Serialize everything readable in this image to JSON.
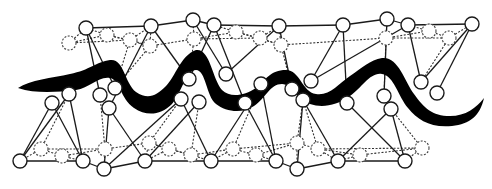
{
  "diagram": {
    "title": "",
    "colors": {
      "background": "#ffffff",
      "line": "#1a1a1a",
      "ribbon": "#000000",
      "node_fill": "#ffffff"
    },
    "node_radius": 7,
    "nodes_solid": [
      {
        "id": "t1",
        "x": 86,
        "y": 28
      },
      {
        "id": "t2",
        "x": 151,
        "y": 26
      },
      {
        "id": "t3",
        "x": 193,
        "y": 20
      },
      {
        "id": "t4",
        "x": 214,
        "y": 25
      },
      {
        "id": "t5",
        "x": 279,
        "y": 26
      },
      {
        "id": "t6",
        "x": 343,
        "y": 25
      },
      {
        "id": "t7",
        "x": 387,
        "y": 19
      },
      {
        "id": "t8",
        "x": 408,
        "y": 25
      },
      {
        "id": "t9",
        "x": 472,
        "y": 24
      },
      {
        "id": "m1",
        "x": 115,
        "y": 88
      },
      {
        "id": "m2",
        "x": 189,
        "y": 79
      },
      {
        "id": "m3",
        "x": 226,
        "y": 74
      },
      {
        "id": "m4",
        "x": 292,
        "y": 89
      },
      {
        "id": "m5",
        "x": 311,
        "y": 81
      },
      {
        "id": "m6",
        "x": 384,
        "y": 96
      },
      {
        "id": "m7",
        "x": 421,
        "y": 82
      },
      {
        "id": "m8",
        "x": 437,
        "y": 93
      },
      {
        "id": "u1",
        "x": 52,
        "y": 103
      },
      {
        "id": "u2",
        "x": 69,
        "y": 94
      },
      {
        "id": "u3",
        "x": 100,
        "y": 95
      },
      {
        "id": "u4",
        "x": 109,
        "y": 108
      },
      {
        "id": "u5",
        "x": 181,
        "y": 99
      },
      {
        "id": "u6",
        "x": 199,
        "y": 102
      },
      {
        "id": "u7",
        "x": 245,
        "y": 103
      },
      {
        "id": "u8",
        "x": 261,
        "y": 84
      },
      {
        "id": "u9",
        "x": 303,
        "y": 100
      },
      {
        "id": "u10",
        "x": 347,
        "y": 103
      },
      {
        "id": "u11",
        "x": 391,
        "y": 109
      },
      {
        "id": "b1",
        "x": 20,
        "y": 161
      },
      {
        "id": "b2",
        "x": 83,
        "y": 161
      },
      {
        "id": "b3",
        "x": 104,
        "y": 169
      },
      {
        "id": "b4",
        "x": 145,
        "y": 161
      },
      {
        "id": "b5",
        "x": 211,
        "y": 161
      },
      {
        "id": "b6",
        "x": 276,
        "y": 161
      },
      {
        "id": "b7",
        "x": 297,
        "y": 169
      },
      {
        "id": "b8",
        "x": 338,
        "y": 161
      },
      {
        "id": "b9",
        "x": 405,
        "y": 161
      }
    ],
    "nodes_dashed": [
      {
        "id": "d1",
        "x": 69,
        "y": 43
      },
      {
        "id": "d2",
        "x": 107,
        "y": 35
      },
      {
        "id": "d3",
        "x": 130,
        "y": 40
      },
      {
        "id": "d4",
        "x": 150,
        "y": 46
      },
      {
        "id": "d5",
        "x": 194,
        "y": 39
      },
      {
        "id": "d6",
        "x": 236,
        "y": 32
      },
      {
        "id": "d7",
        "x": 260,
        "y": 38
      },
      {
        "id": "d8",
        "x": 281,
        "y": 45
      },
      {
        "id": "d9",
        "x": 386,
        "y": 38
      },
      {
        "id": "d10",
        "x": 429,
        "y": 31
      },
      {
        "id": "d11",
        "x": 449,
        "y": 38
      },
      {
        "id": "e1",
        "x": 41,
        "y": 149
      },
      {
        "id": "e2",
        "x": 62,
        "y": 156
      },
      {
        "id": "e3",
        "x": 105,
        "y": 149
      },
      {
        "id": "e4",
        "x": 149,
        "y": 143
      },
      {
        "id": "e5",
        "x": 169,
        "y": 149
      },
      {
        "id": "e6",
        "x": 191,
        "y": 155
      },
      {
        "id": "e7",
        "x": 233,
        "y": 149
      },
      {
        "id": "e8",
        "x": 256,
        "y": 155
      },
      {
        "id": "e9",
        "x": 297,
        "y": 143
      },
      {
        "id": "e10",
        "x": 318,
        "y": 149
      },
      {
        "id": "e11",
        "x": 360,
        "y": 155
      },
      {
        "id": "e12",
        "x": 422,
        "y": 148
      }
    ],
    "edges_solid": [
      [
        "t1",
        "t2"
      ],
      [
        "t2",
        "t3"
      ],
      [
        "t3",
        "t4"
      ],
      [
        "t4",
        "t5"
      ],
      [
        "t5",
        "t6"
      ],
      [
        "t6",
        "t7"
      ],
      [
        "t7",
        "t8"
      ],
      [
        "t8",
        "t9"
      ],
      [
        "t1",
        "m1"
      ],
      [
        "t1",
        "u3"
      ],
      [
        "t2",
        "u4"
      ],
      [
        "t2",
        "m2"
      ],
      [
        "t3",
        "m3"
      ],
      [
        "t4",
        "m2"
      ],
      [
        "t4",
        "u7"
      ],
      [
        "t5",
        "m3"
      ],
      [
        "t5",
        "m4"
      ],
      [
        "t6",
        "m5"
      ],
      [
        "t6",
        "u10"
      ],
      [
        "t7",
        "m6"
      ],
      [
        "t8",
        "m5"
      ],
      [
        "t8",
        "m7"
      ],
      [
        "t9",
        "m7"
      ],
      [
        "t9",
        "m8"
      ],
      [
        "b1",
        "b2"
      ],
      [
        "b2",
        "b3"
      ],
      [
        "b3",
        "b4"
      ],
      [
        "b4",
        "b5"
      ],
      [
        "b5",
        "b6"
      ],
      [
        "b6",
        "b7"
      ],
      [
        "b7",
        "b8"
      ],
      [
        "b8",
        "b9"
      ],
      [
        "b1",
        "u1"
      ],
      [
        "b1",
        "u2"
      ],
      [
        "b2",
        "u2"
      ],
      [
        "b2",
        "u1"
      ],
      [
        "b3",
        "u4"
      ],
      [
        "b3",
        "u5"
      ],
      [
        "b4",
        "u4"
      ],
      [
        "b4",
        "u6"
      ],
      [
        "b5",
        "u5"
      ],
      [
        "b5",
        "u8"
      ],
      [
        "b6",
        "u8"
      ],
      [
        "b6",
        "u7"
      ],
      [
        "b7",
        "u9"
      ],
      [
        "b8",
        "u9"
      ],
      [
        "b8",
        "u11"
      ],
      [
        "b9",
        "u11"
      ],
      [
        "b9",
        "u10"
      ]
    ],
    "edges_dashed": [
      [
        "d1",
        "d2"
      ],
      [
        "d2",
        "d3"
      ],
      [
        "d3",
        "d4"
      ],
      [
        "d4",
        "d5"
      ],
      [
        "d5",
        "d6"
      ],
      [
        "d6",
        "d7"
      ],
      [
        "d7",
        "d8"
      ],
      [
        "d8",
        "d9"
      ],
      [
        "d9",
        "d10"
      ],
      [
        "d10",
        "d11"
      ],
      [
        "d1",
        "t1"
      ],
      [
        "d2",
        "t1"
      ],
      [
        "d3",
        "t2"
      ],
      [
        "d4",
        "t2"
      ],
      [
        "d5",
        "t3"
      ],
      [
        "d6",
        "t4"
      ],
      [
        "d7",
        "t5"
      ],
      [
        "d8",
        "t5"
      ],
      [
        "d9",
        "t7"
      ],
      [
        "d10",
        "t8"
      ],
      [
        "d11",
        "t9"
      ],
      [
        "d1",
        "d3"
      ],
      [
        "d2",
        "d4"
      ],
      [
        "d5",
        "d7"
      ],
      [
        "d6",
        "d8"
      ],
      [
        "d9",
        "d11"
      ],
      [
        "d3",
        "m1"
      ],
      [
        "d4",
        "m1"
      ],
      [
        "d5",
        "m2"
      ],
      [
        "d8",
        "m4"
      ],
      [
        "d9",
        "m6"
      ],
      [
        "d11",
        "m7"
      ],
      [
        "e1",
        "e2"
      ],
      [
        "e2",
        "e3"
      ],
      [
        "e3",
        "e4"
      ],
      [
        "e4",
        "e5"
      ],
      [
        "e5",
        "e6"
      ],
      [
        "e6",
        "e7"
      ],
      [
        "e7",
        "e8"
      ],
      [
        "e8",
        "e9"
      ],
      [
        "e9",
        "e10"
      ],
      [
        "e10",
        "e11"
      ],
      [
        "e11",
        "e12"
      ],
      [
        "e1",
        "b1"
      ],
      [
        "e2",
        "b2"
      ],
      [
        "e3",
        "b3"
      ],
      [
        "e4",
        "b4"
      ],
      [
        "e5",
        "b4"
      ],
      [
        "e6",
        "b5"
      ],
      [
        "e7",
        "b5"
      ],
      [
        "e8",
        "b6"
      ],
      [
        "e9",
        "b7"
      ],
      [
        "e10",
        "b8"
      ],
      [
        "e11",
        "b8"
      ],
      [
        "e12",
        "b9"
      ],
      [
        "e1",
        "u2"
      ],
      [
        "e3",
        "u3"
      ],
      [
        "e4",
        "u5"
      ],
      [
        "e6",
        "u6"
      ],
      [
        "e7",
        "u8"
      ],
      [
        "e9",
        "u9"
      ],
      [
        "e10",
        "u9"
      ],
      [
        "e12",
        "u11"
      ],
      [
        "e1",
        "e3"
      ],
      [
        "e4",
        "e6"
      ],
      [
        "e7",
        "e9"
      ],
      [
        "e10",
        "e12"
      ]
    ],
    "ribbon_path": "M18,88 C30,80 52,78 70,74 C90,70 96,62 110,60 C124,58 124,82 136,92 C148,100 156,96 166,86 C176,76 180,56 196,50 C210,48 212,78 222,90 C230,98 244,96 256,88 C266,80 270,70 286,70 C300,70 302,92 316,94 C330,96 338,84 350,76 C362,68 370,60 382,58 C398,56 404,80 414,94 C424,108 432,116 450,116 C466,116 476,108 484,98 C480,116 470,124 452,126 C430,128 418,120 408,108 C398,96 394,76 382,74 C370,72 362,88 350,96 C336,106 322,108 310,104 C296,100 292,84 282,84 C270,84 266,98 254,106 C242,114 226,112 216,104 C206,96 206,70 196,70 C186,70 182,92 172,104 C160,116 146,116 134,108 C120,98 120,80 110,78 C98,76 90,88 76,90 C58,92 36,94 18,88 Z"
  }
}
